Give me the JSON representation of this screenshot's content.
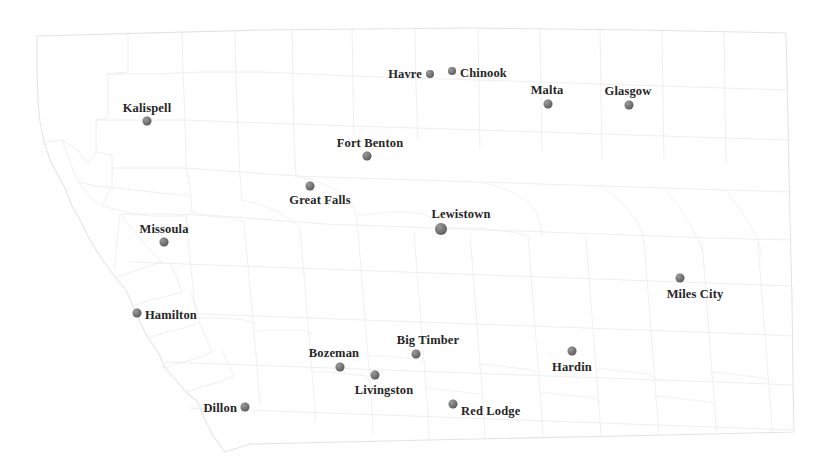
{
  "map": {
    "title": "Montana Cities Map",
    "region": "Montana",
    "background_color": "#ffffff",
    "boundary_color": "#e7e7e7",
    "boundary_color_light": "#f0f0f0",
    "marker_color": "#6b6b6b",
    "label_color": "#262626",
    "width": 813,
    "height": 460
  },
  "cities": [
    {
      "name": "Kalispell",
      "x": 147,
      "y": 121,
      "r": 4.5,
      "label_pos": "above",
      "label_x": 147,
      "label_y": 114
    },
    {
      "name": "Havre",
      "x": 430,
      "y": 74,
      "r": 4.0,
      "label_pos": "left",
      "label_x": 422,
      "label_y": 74
    },
    {
      "name": "Chinook",
      "x": 452,
      "y": 71,
      "r": 4.0,
      "label_pos": "right",
      "label_x": 460,
      "label_y": 73
    },
    {
      "name": "Malta",
      "x": 548,
      "y": 104,
      "r": 4.5,
      "label_pos": "above",
      "label_x": 547,
      "label_y": 96
    },
    {
      "name": "Glasgow",
      "x": 629,
      "y": 105,
      "r": 4.5,
      "label_pos": "above",
      "label_x": 628,
      "label_y": 97
    },
    {
      "name": "Fort Benton",
      "x": 367,
      "y": 156,
      "r": 4.5,
      "label_pos": "above",
      "label_x": 370,
      "label_y": 149
    },
    {
      "name": "Great Falls",
      "x": 310,
      "y": 186,
      "r": 4.5,
      "label_pos": "below",
      "label_x": 320,
      "label_y": 194
    },
    {
      "name": "Lewistown",
      "x": 441,
      "y": 229,
      "r": 6.0,
      "label_pos": "above",
      "label_x": 461,
      "label_y": 220
    },
    {
      "name": "Missoula",
      "x": 164,
      "y": 242,
      "r": 4.5,
      "label_pos": "above",
      "label_x": 164,
      "label_y": 235
    },
    {
      "name": "Miles City",
      "x": 680,
      "y": 278,
      "r": 4.5,
      "label_pos": "below",
      "label_x": 695,
      "label_y": 288
    },
    {
      "name": "Hamilton",
      "x": 137,
      "y": 313,
      "r": 4.5,
      "label_pos": "right",
      "label_x": 145,
      "label_y": 315
    },
    {
      "name": "Big Timber",
      "x": 416,
      "y": 354,
      "r": 4.5,
      "label_pos": "above",
      "label_x": 428,
      "label_y": 346
    },
    {
      "name": "Bozeman",
      "x": 340,
      "y": 367,
      "r": 4.5,
      "label_pos": "above",
      "label_x": 334,
      "label_y": 359
    },
    {
      "name": "Hardin",
      "x": 572,
      "y": 351,
      "r": 4.5,
      "label_pos": "below",
      "label_x": 572,
      "label_y": 361
    },
    {
      "name": "Livingston",
      "x": 375,
      "y": 375,
      "r": 4.5,
      "label_pos": "below",
      "label_x": 384,
      "label_y": 384
    },
    {
      "name": "Dillon",
      "x": 245,
      "y": 407,
      "r": 4.5,
      "label_pos": "left",
      "label_x": 237,
      "label_y": 408
    },
    {
      "name": "Red Lodge",
      "x": 453,
      "y": 404,
      "r": 4.5,
      "label_pos": "right",
      "label_x": 461,
      "label_y": 411
    }
  ]
}
